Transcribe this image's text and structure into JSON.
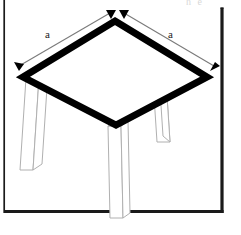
{
  "figure": {
    "background_color": "#ffffff",
    "width": 241,
    "height": 235,
    "clipped_header_text": "h  e",
    "frame": {
      "line_color": "#1a1a1a",
      "left_rule_x": 4,
      "left_rule_thickness": 1.6,
      "inner_right_x": 222,
      "inner_bottom_y": 212,
      "inner_thickness": 3.2
    },
    "tabletop": {
      "name": "square-tabletop",
      "shape": "rhombus",
      "stroke_color": "#000000",
      "stroke_width": 7,
      "fill": "#ffffff",
      "vertices": {
        "top": [
          115,
          21
        ],
        "left": [
          23,
          77
        ],
        "right": [
          207,
          77
        ],
        "bottom": [
          116,
          125
        ]
      }
    },
    "legs": [
      {
        "name": "table-leg-left",
        "stroke_color": "#b0b0b0",
        "top_x": 26,
        "top_y": 78,
        "width": 13,
        "height": 92,
        "skew_dx": -6,
        "depth_dx": 9,
        "depth_dy": -6
      },
      {
        "name": "table-leg-right-rear",
        "stroke_color": "#b0b0b0",
        "top_x": 151,
        "top_y": 50,
        "width": 13,
        "height": 92,
        "skew_dx": 6,
        "depth_dx": 9,
        "depth_dy": -6
      },
      {
        "name": "table-leg-front-center",
        "stroke_color": "#b0b0b0",
        "top_x": 108,
        "top_y": 126,
        "width": 13,
        "height": 92,
        "skew_dx": 2,
        "depth_dx": 9,
        "depth_dy": -6
      }
    ],
    "dimensions": [
      {
        "name": "dimension-a-left-edge",
        "label": "a",
        "label_x": 45,
        "label_y": 29,
        "line_color": "#7a7a7a",
        "arrow_color": "#000000",
        "start": [
          18,
          67
        ],
        "end": [
          110,
          13
        ]
      },
      {
        "name": "dimension-a-right-edge",
        "label": "a",
        "label_x": 168,
        "label_y": 29,
        "line_color": "#7a7a7a",
        "arrow_color": "#000000",
        "start": [
          123,
          13
        ],
        "end": [
          214,
          67
        ]
      }
    ]
  }
}
